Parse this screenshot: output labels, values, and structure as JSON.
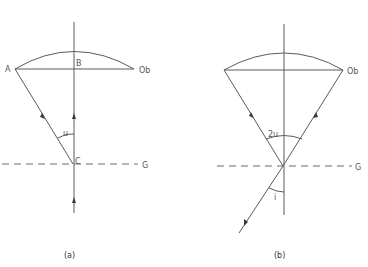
{
  "panels": [
    {
      "id": "a",
      "caption": "(a)",
      "labels": {
        "point_a": "A",
        "point_b": "B",
        "point_c": "C",
        "objective": "Ob",
        "angle": "u",
        "ground": "G"
      }
    },
    {
      "id": "b",
      "caption": "(b)",
      "labels": {
        "objective": "Ob",
        "angle_top": "2u",
        "angle_bottom": "i",
        "ground": "G"
      }
    }
  ],
  "colors": {
    "line": "#5a5a5a",
    "text": "#555555",
    "background": "#ffffff"
  }
}
